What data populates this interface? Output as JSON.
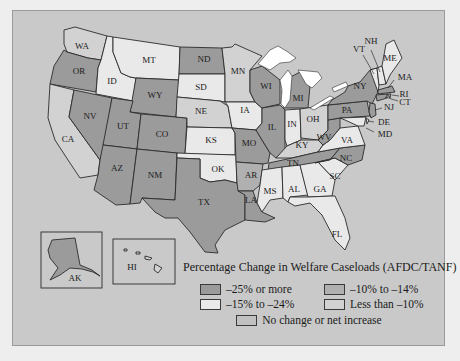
{
  "title": "Percentage Change in Welfare Caseloads (AFDC/TANF)",
  "legend": {
    "title": "Percentage Change in Welfare Caseloads (AFDC/TANF)",
    "items": [
      {
        "key": "dark",
        "label": "–25% or more",
        "color": "#9b9b9b"
      },
      {
        "key": "mid",
        "label": "–10% to –14%",
        "color": "#b0b0b0"
      },
      {
        "key": "white",
        "label": "–15% to –24%",
        "color": "#e9e9e9"
      },
      {
        "key": "light",
        "label": "Less than –10%",
        "color": "#d2d2d2"
      },
      {
        "key": "none",
        "label": "No change or net increase",
        "color": "#c1c1c1"
      }
    ]
  },
  "states": {
    "WA": "light",
    "OR": "dark",
    "CA": "light",
    "ID": "white",
    "NV": "dark",
    "MT": "white",
    "WY": "dark",
    "UT": "dark",
    "AZ": "dark",
    "CO": "dark",
    "NM": "dark",
    "ND": "dark",
    "SD": "white",
    "NE": "light",
    "KS": "white",
    "OK": "white",
    "TX": "dark",
    "MN": "light",
    "IA": "white",
    "MO": "dark",
    "AR": "mid",
    "LA": "dark",
    "WI": "dark",
    "IL": "dark",
    "MI": "dark",
    "IN": "white",
    "OH": "light",
    "KY": "light",
    "TN": "dark",
    "MS": "white",
    "AL": "white",
    "GA": "white",
    "FL": "white",
    "SC": "white",
    "NC": "dark",
    "VA": "white",
    "WV": "dark",
    "PA": "dark",
    "NY": "dark",
    "VT": "white",
    "NH": "white",
    "ME": "white",
    "MA": "dark",
    "RI": "dark",
    "CT": "dark",
    "NJ": "dark",
    "DE": "white",
    "MD": "white",
    "AK": "dark",
    "HI": "light"
  },
  "labels": {
    "WA": "WA",
    "OR": "OR",
    "CA": "CA",
    "ID": "ID",
    "NV": "NV",
    "MT": "MT",
    "WY": "WY",
    "UT": "UT",
    "AZ": "AZ",
    "CO": "CO",
    "NM": "NM",
    "ND": "ND",
    "SD": "SD",
    "NE": "NE",
    "KS": "KS",
    "OK": "OK",
    "TX": "TX",
    "MN": "MN",
    "IA": "IA",
    "MO": "MO",
    "AR": "AR",
    "LA": "LA",
    "WI": "WI",
    "IL": "IL",
    "MI": "MI",
    "IN": "IN",
    "OH": "OH",
    "KY": "KY",
    "TN": "TN",
    "MS": "MS",
    "AL": "AL",
    "GA": "GA",
    "FL": "FL",
    "SC": "SC",
    "NC": "NC",
    "VA": "VA",
    "WV": "WV",
    "PA": "PA",
    "NY": "NY",
    "VT": "VT",
    "NH": "NH",
    "ME": "ME",
    "MA": "MA",
    "RI": "RI",
    "CT": "CT",
    "NJ": "NJ",
    "DE": "DE",
    "MD": "MD",
    "AK": "AK",
    "HI": "HI"
  }
}
